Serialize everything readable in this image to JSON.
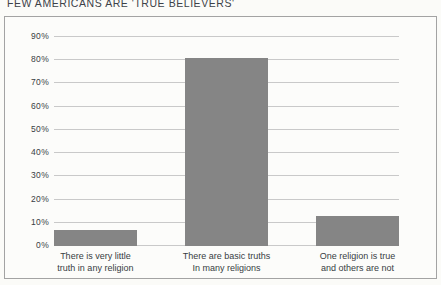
{
  "title": "FEW AMERICANS ARE 'TRUE BELIEVERS'",
  "colors": {
    "bar": "#858585",
    "gridline": "#c9c9c9",
    "frame_border": "#a3a3a3",
    "background": "#fbfbf8",
    "text": "#383d43"
  },
  "chart_data": {
    "type": "bar",
    "title": "FEW AMERICANS ARE 'TRUE BELIEVERS'",
    "categories": [
      "There is very little truth in any religion",
      "There are basic truths In many religions",
      "One religion is true and others are not"
    ],
    "category_label_lines": [
      [
        "There is very little",
        "truth in any religion"
      ],
      [
        "There are basic truths",
        "In many religions"
      ],
      [
        "One religion is true",
        "and others are not"
      ]
    ],
    "values": [
      7,
      81,
      13
    ],
    "xlabel": "",
    "ylabel": "",
    "ylim": [
      0,
      90
    ],
    "ytick_labels": [
      "0%",
      "10%",
      "20%",
      "30%",
      "40%",
      "50%",
      "60%",
      "70%",
      "80%",
      "90%"
    ],
    "grid": true,
    "legend": false,
    "bar_color": "#858585"
  }
}
